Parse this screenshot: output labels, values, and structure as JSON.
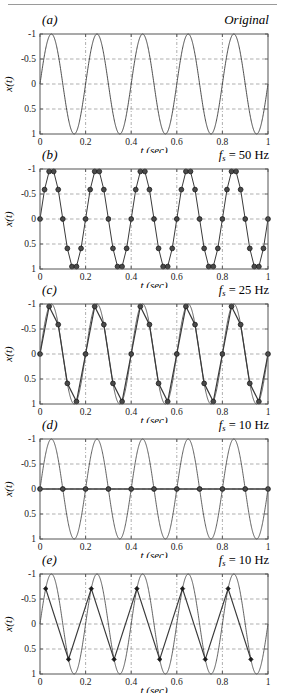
{
  "figure": {
    "width": 281,
    "height": 699,
    "background": "#ffffff",
    "rule_color": "#9a9a9a",
    "axis_color": "#555555",
    "curve_color": "#3a3a3a",
    "grid_color": "#8c8c8c",
    "marker_color": "#1a1a1a"
  },
  "axes_common": {
    "xlabel": "t (sec)",
    "ylabel": "x(t)",
    "xticks": [
      "0",
      "0.2",
      "0.4",
      "0.6",
      "0.8",
      "1"
    ],
    "xtick_values": [
      0,
      0.2,
      0.4,
      0.6,
      0.8,
      1
    ],
    "yticks": [
      "1",
      "0.5",
      "0",
      "-0.5",
      "-1"
    ],
    "ytick_values": [
      1,
      0.5,
      0,
      -0.5,
      -1
    ],
    "xlim": [
      0,
      1
    ],
    "ylim": [
      -1,
      1
    ],
    "grid": true,
    "grid_style": "dashed-dotted"
  },
  "panels": [
    {
      "tag": "(a)",
      "note_text": "Original",
      "note_style": "italic",
      "note_symbol": "",
      "note_sub": "",
      "note_value": "",
      "top": 12,
      "chart_data": {
        "type": "line",
        "title": "Original",
        "xlabel": "t (sec)",
        "ylabel": "x(t)",
        "xlim": [
          0,
          1
        ],
        "ylim": [
          -1,
          1
        ],
        "xticks": [
          0,
          0.2,
          0.4,
          0.6,
          0.8,
          1
        ],
        "yticks": [
          -1,
          -0.5,
          0,
          0.5,
          1
        ],
        "grid": true,
        "legend": "none",
        "series": [
          {
            "name": "continuous 5 Hz sine",
            "kind": "analytic_sine",
            "amplitude": 1,
            "frequency_hz": 5,
            "phase_rad": 0,
            "markers": false,
            "linewidth": 0.9
          }
        ]
      }
    },
    {
      "tag": "(b)",
      "note_text": "fs = 50 Hz",
      "note_style": "formula",
      "note_symbol": "f",
      "note_sub": "s",
      "note_value": " = 50 Hz",
      "top": 147,
      "chart_data": {
        "type": "line",
        "title": "fs = 50 Hz",
        "xlabel": "t (sec)",
        "ylabel": "x(t)",
        "xlim": [
          0,
          1
        ],
        "ylim": [
          -1,
          1
        ],
        "xticks": [
          0,
          0.2,
          0.4,
          0.6,
          0.8,
          1
        ],
        "yticks": [
          -1,
          -0.5,
          0,
          0.5,
          1
        ],
        "grid": true,
        "legend": "none",
        "sampling_rate_hz": 50,
        "signal_frequency_hz": 5,
        "samples_per_cycle": 10,
        "sample_values_one_cycle": [
          0,
          0.588,
          0.951,
          0.951,
          0.588,
          0,
          -0.588,
          -0.951,
          -0.951,
          -0.588
        ],
        "series": [
          {
            "name": "sampled 5 Hz sine (fs = 50 Hz)",
            "kind": "sampled_sine",
            "amplitude": 1,
            "frequency_hz": 5,
            "phase_rad": 0,
            "sample_rate_hz": 50,
            "sample_offset_s": 0,
            "markers": true,
            "marker_shape": "circle",
            "marker_size": 2.4,
            "linewidth": 1.0
          }
        ]
      }
    },
    {
      "tag": "(c)",
      "note_text": "fs = 25 Hz",
      "note_style": "formula",
      "note_symbol": "f",
      "note_sub": "s",
      "note_value": " = 25 Hz",
      "top": 282,
      "chart_data": {
        "type": "line",
        "title": "fs = 25 Hz",
        "xlabel": "t (sec)",
        "ylabel": "x(t)",
        "xlim": [
          0,
          1
        ],
        "ylim": [
          -1,
          1
        ],
        "xticks": [
          0,
          0.2,
          0.4,
          0.6,
          0.8,
          1
        ],
        "yticks": [
          -1,
          -0.5,
          0,
          0.5,
          1
        ],
        "grid": true,
        "legend": "none",
        "sampling_rate_hz": 25,
        "signal_frequency_hz": 5,
        "samples_per_cycle": 5,
        "sample_values_one_cycle": [
          0,
          0.951,
          0.588,
          -0.588,
          -0.951
        ],
        "series": [
          {
            "name": "continuous 5 Hz sine",
            "kind": "analytic_sine",
            "amplitude": 1,
            "frequency_hz": 5,
            "phase_rad": 0,
            "markers": false,
            "linewidth": 0.8
          },
          {
            "name": "sampled 5 Hz sine (fs = 25 Hz)",
            "kind": "sampled_sine",
            "amplitude": 1,
            "frequency_hz": 5,
            "phase_rad": 0,
            "sample_rate_hz": 25,
            "sample_offset_s": 0,
            "markers": true,
            "marker_shape": "circle",
            "marker_size": 2.4,
            "linewidth": 1.2
          }
        ]
      }
    },
    {
      "tag": "(d)",
      "note_text": "fs = 10 Hz",
      "note_style": "formula",
      "note_symbol": "f",
      "note_sub": "s",
      "note_value": " = 10 Hz",
      "top": 417,
      "chart_data": {
        "type": "line",
        "title": "fs = 10 Hz",
        "xlabel": "t (sec)",
        "ylabel": "x(t)",
        "xlim": [
          0,
          1
        ],
        "ylim": [
          -1,
          1
        ],
        "xticks": [
          0,
          0.2,
          0.4,
          0.6,
          0.8,
          1
        ],
        "yticks": [
          -1,
          -0.5,
          0,
          0.5,
          1
        ],
        "grid": true,
        "legend": "none",
        "sampling_rate_hz": 10,
        "signal_frequency_hz": 5,
        "samples_per_cycle": 2,
        "sample_values_one_cycle": [
          0,
          0
        ],
        "note": "samples land on zero crossings; reconstruction is a flat zero line",
        "series": [
          {
            "name": "continuous 5 Hz sine",
            "kind": "analytic_sine",
            "amplitude": 1,
            "frequency_hz": 5,
            "phase_rad": 0,
            "markers": false,
            "linewidth": 0.8
          },
          {
            "name": "sampled 5 Hz sine (fs = 10 Hz, zero phase)",
            "kind": "sampled_sine",
            "amplitude": 1,
            "frequency_hz": 5,
            "phase_rad": 0,
            "sample_rate_hz": 10,
            "sample_offset_s": 0,
            "markers": true,
            "marker_shape": "circle",
            "marker_size": 2.4,
            "linewidth": 1.4
          }
        ]
      }
    },
    {
      "tag": "(e)",
      "note_text": "fs = 10 Hz",
      "note_style": "formula",
      "note_symbol": "f",
      "note_sub": "s",
      "note_value": " = 10 Hz",
      "top": 552,
      "chart_data": {
        "type": "line",
        "title": "fs = 10 Hz",
        "xlabel": "t (sec)",
        "ylabel": "x(t)",
        "xlim": [
          0,
          1
        ],
        "ylim": [
          -1,
          1
        ],
        "xticks": [
          0,
          0.2,
          0.4,
          0.6,
          0.8,
          1
        ],
        "yticks": [
          -1,
          -0.5,
          0,
          0.5,
          1
        ],
        "grid": true,
        "legend": "none",
        "sampling_rate_hz": 10,
        "signal_frequency_hz": 5,
        "samples_per_cycle": 2,
        "sample_offset_s": 0.025,
        "sample_values_one_cycle": [
          0.707,
          -0.707
        ],
        "note": "samples offset by 1/8 cycle give alternating +-0.707 values",
        "series": [
          {
            "name": "continuous 5 Hz sine",
            "kind": "analytic_sine",
            "amplitude": 1,
            "frequency_hz": 5,
            "phase_rad": 0,
            "markers": false,
            "linewidth": 0.8
          },
          {
            "name": "sampled 5 Hz sine (fs = 10 Hz, offset 0.025 s)",
            "kind": "sampled_sine",
            "amplitude": 1,
            "frequency_hz": 5,
            "phase_rad": 0,
            "sample_rate_hz": 10,
            "sample_offset_s": 0.025,
            "markers": true,
            "marker_shape": "diamond",
            "marker_size": 2.3,
            "linewidth": 1.2
          }
        ]
      }
    }
  ]
}
